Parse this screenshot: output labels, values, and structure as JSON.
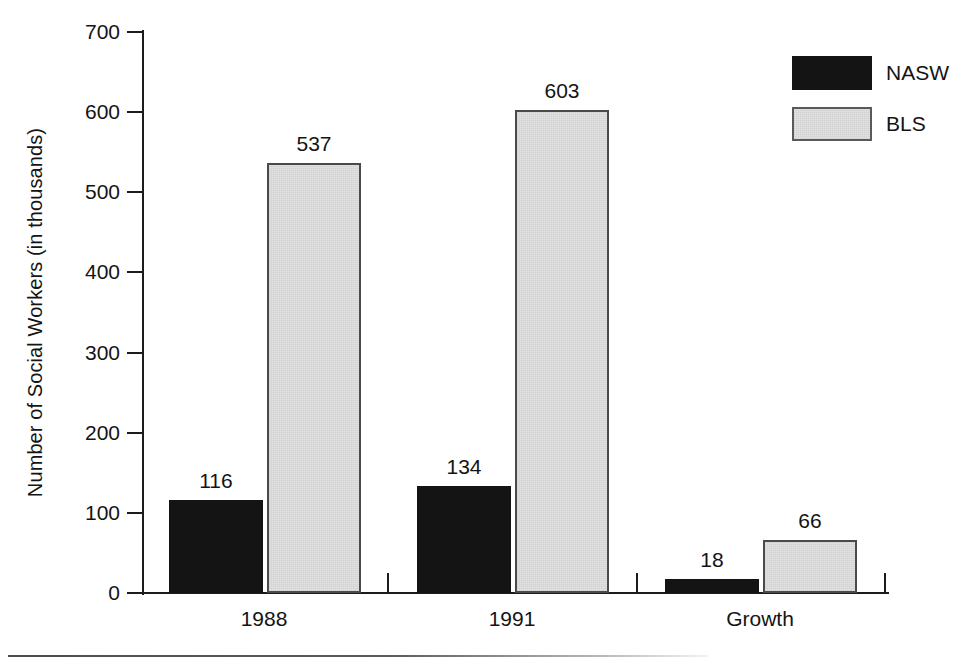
{
  "chart_data": {
    "type": "bar",
    "title": "",
    "subtitle": "",
    "xlabel": "",
    "ylabel": "Number of Social Workers (in thousands)",
    "categories": [
      "1988",
      "1991",
      "Growth"
    ],
    "series": [
      {
        "name": "NASW",
        "color": "#141414",
        "values": [
          116,
          134,
          18
        ]
      },
      {
        "name": "BLS",
        "color": "#e2e2e2",
        "values": [
          537,
          603,
          66
        ]
      }
    ],
    "ylim": [
      0,
      700
    ],
    "ytick_labels": [
      "700",
      "600",
      "500",
      "400",
      "300",
      "200",
      "100",
      "0"
    ],
    "ytick_values": [
      700,
      600,
      500,
      400,
      300,
      200,
      100,
      0
    ],
    "grid": false,
    "legend_position": "top-right",
    "data_labels": [
      "116",
      "537",
      "134",
      "603",
      "18",
      "66"
    ]
  },
  "legend": {
    "items": [
      {
        "label": "NASW",
        "swatch": "black-swatch"
      },
      {
        "label": "BLS",
        "swatch": "light-gray-swatch"
      }
    ]
  },
  "axis": {
    "y_title": "Number of Social Workers (in thousands)"
  }
}
